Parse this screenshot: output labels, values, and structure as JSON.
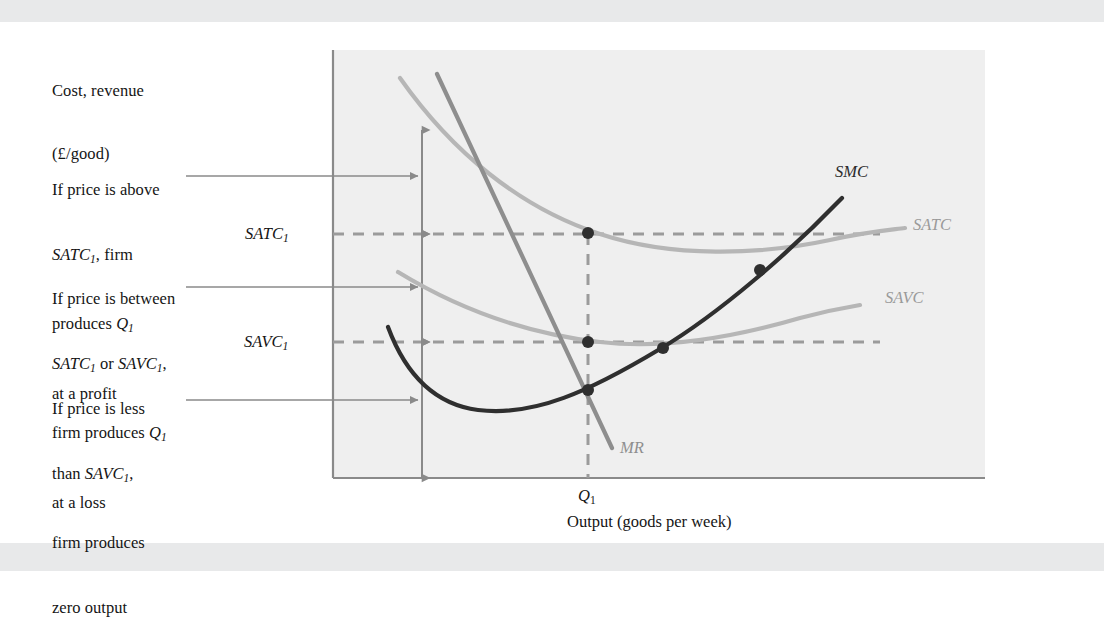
{
  "figure": {
    "background": "#ffffff",
    "band_color": "#e8e9ea",
    "plot_background": "#efefef"
  },
  "axes": {
    "y_title_line1": "Cost, revenue",
    "y_title_line2": "(£/good)",
    "x_title": "Output (goods per week)",
    "x_tick_label": "Q",
    "x_tick_sub": "1",
    "y_tick_satc": "SATC",
    "y_tick_satc_sub": "1",
    "y_tick_savc": "SAVC",
    "y_tick_savc_sub": "1",
    "axis_color": "#8a8a8a"
  },
  "annotations": [
    {
      "id": "above-satc",
      "lines": [
        {
          "plain": "If price is above"
        },
        {
          "italic": "SATC",
          "sub": "1",
          "trailing": ", firm"
        },
        {
          "plain": "produces ",
          "italic": "Q",
          "sub": "1"
        },
        {
          "plain": "at a profit"
        }
      ],
      "leader_from_x": 186,
      "leader_to_x": 422,
      "leader_y": 176
    },
    {
      "id": "between-satc-savc",
      "lines": [
        {
          "plain": "If price is between"
        },
        {
          "italic": "SATC",
          "sub": "1",
          "trailing": " or ",
          "italic2": "SAVC",
          "sub2": "1",
          "trailing2": ","
        },
        {
          "plain": "firm produces ",
          "italic": "Q",
          "sub": "1"
        },
        {
          "plain": "at a loss"
        }
      ],
      "leader_from_x": 186,
      "leader_to_x": 422,
      "leader_y": 287
    },
    {
      "id": "below-savc",
      "lines": [
        {
          "plain": "If price is less"
        },
        {
          "plain": "than ",
          "italic": "SAVC",
          "sub": "1",
          "trailing": ","
        },
        {
          "plain": "firm produces"
        },
        {
          "plain": "zero output"
        }
      ],
      "leader_from_x": 186,
      "leader_to_x": 422,
      "leader_y": 400
    }
  ],
  "curve_labels": {
    "smc": "SMC",
    "satc": "SATC",
    "savc": "SAVC",
    "mr": "MR"
  },
  "chart_data": {
    "type": "line",
    "title": "",
    "xlabel": "Output (goods per week)",
    "ylabel": "Cost, revenue (£/good)",
    "grid": false,
    "legend": "inline-curve-labels",
    "axis_ranges": {
      "x_px": [
        333,
        985
      ],
      "y_px": [
        50,
        478
      ]
    },
    "reference_levels": [
      {
        "name": "SATC_1",
        "y_px": 234,
        "label": "SATC1"
      },
      {
        "name": "SAVC_1",
        "y_px": 342,
        "label": "SAVC1"
      }
    ],
    "reference_quantity": {
      "name": "Q_1",
      "x_px": 588,
      "label": "Q1"
    },
    "series": [
      {
        "name": "SMC",
        "color": "#2f2f2f",
        "width": 4.2,
        "path": "M 388,327 C 404,370 432,404 478,410 C 534,417 590,391 660,349 C 720,313 790,252 842,198"
      },
      {
        "name": "SATC",
        "color": "#b6b6b6",
        "width": 4.2,
        "path": "M 400,78 C 452,152 520,208 600,234 C 672,258 760,255 830,240 C 866,232 890,230 905,228"
      },
      {
        "name": "SAVC",
        "color": "#b6b6b6",
        "width": 4.2,
        "path": "M 398,272 C 452,305 520,333 600,342 C 668,350 742,335 800,318 C 830,310 848,307 860,305"
      },
      {
        "name": "MR",
        "color": "#8e8e8e",
        "width": 4.2,
        "path": "M 437,74 L 612,448"
      }
    ],
    "intersection_points": [
      {
        "label": "SATC at Q1",
        "x_px": 588,
        "y_px": 233,
        "color": "#2f2f2f"
      },
      {
        "label": "SAVC at Q1",
        "x_px": 588,
        "y_px": 342,
        "color": "#2f2f2f"
      },
      {
        "label": "SMC crosses MR at Q1",
        "x_px": 588,
        "y_px": 390,
        "color": "#2f2f2f"
      },
      {
        "label": "SMC crosses SAVC minimum",
        "x_px": 663,
        "y_px": 348,
        "color": "#2f2f2f"
      },
      {
        "label": "SMC crosses SATC minimum",
        "x_px": 760,
        "y_px": 270,
        "color": "#2f2f2f"
      }
    ],
    "range_arrows": [
      {
        "label": "above SATC1",
        "x_px": 422,
        "y_top": 130,
        "y_bottom": 234
      },
      {
        "label": "between SATC1 and SAVC1",
        "x_px": 422,
        "y_top": 234,
        "y_bottom": 342
      },
      {
        "label": "below SAVC1",
        "x_px": 422,
        "y_top": 342,
        "y_bottom": 478
      }
    ]
  }
}
